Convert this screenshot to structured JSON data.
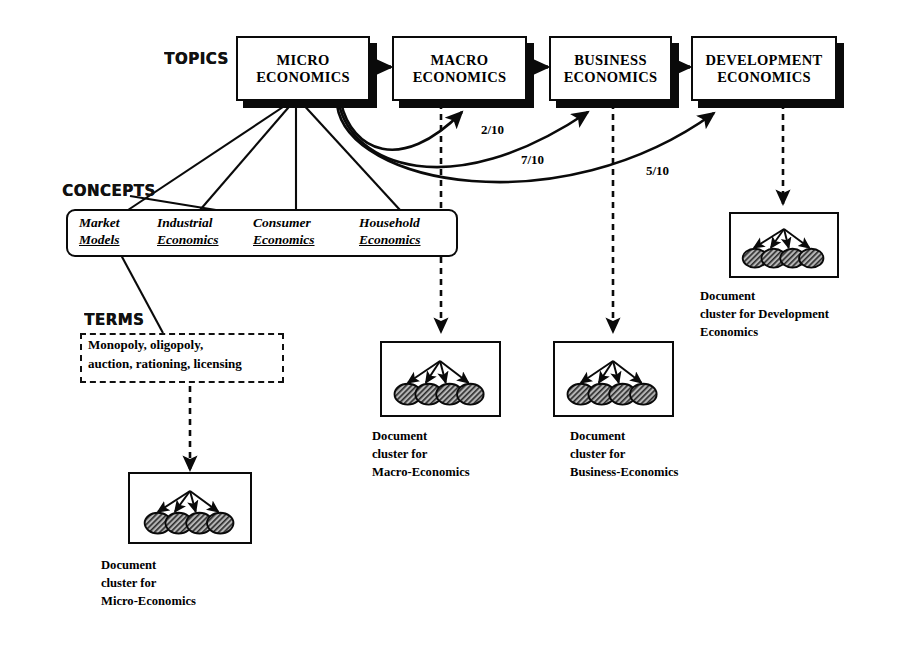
{
  "diagram": {
    "sections": {
      "topics_label": "TOPICS",
      "concepts_label": "CONCEPTS",
      "terms_label": "TERMS"
    },
    "topics": [
      {
        "id": "micro",
        "line1": "MICRO",
        "line2": "ECONOMICS"
      },
      {
        "id": "macro",
        "line1": "MACRO",
        "line2": "ECONOMICS"
      },
      {
        "id": "business",
        "line1": "BUSINESS",
        "line2": "ECONOMICS"
      },
      {
        "id": "development",
        "line1": "DEVELOPMENT",
        "line2": "ECONOMICS"
      }
    ],
    "concepts": [
      {
        "id": "market-models",
        "line1": "Market",
        "line2": "Models"
      },
      {
        "id": "industrial-economics",
        "line1": "Industrial",
        "line2": "Economics"
      },
      {
        "id": "consumer-economics",
        "line1": "Consumer",
        "line2": "Economics"
      },
      {
        "id": "household-economics",
        "line1": "Household",
        "line2": "Economics"
      }
    ],
    "terms": {
      "line1": "Monopoly, oligopoly,",
      "line2": "auction, rationing, licensing"
    },
    "ratios": [
      {
        "id": "micro-to-macro",
        "value": "2/10"
      },
      {
        "id": "micro-to-business",
        "value": "7/10"
      },
      {
        "id": "micro-to-development",
        "value": "5/10"
      }
    ],
    "clusters": [
      {
        "id": "micro",
        "caption_line1": "Document",
        "caption_line2": "cluster for",
        "caption_line3": "Micro-Economics",
        "node_count": 4
      },
      {
        "id": "macro",
        "caption_line1": "Document",
        "caption_line2": "cluster for",
        "caption_line3": "Macro-Economics",
        "node_count": 4
      },
      {
        "id": "business",
        "caption_line1": "Document",
        "caption_line2": "cluster for",
        "caption_line3": "Business-Economics",
        "node_count": 4
      },
      {
        "id": "development",
        "caption_line1": "Document",
        "caption_line2": "cluster for Development",
        "caption_line3": "Economics",
        "node_count": 4
      }
    ],
    "colors": {
      "ink": "#0a0a0a",
      "paper": "#ffffff",
      "node_fill": "#8a8a8a"
    }
  }
}
